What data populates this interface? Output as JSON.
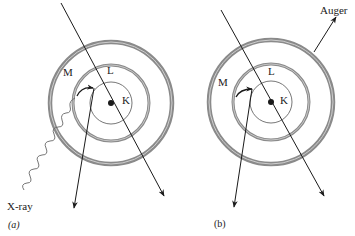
{
  "figure": {
    "panels": [
      {
        "id": "a",
        "caption": "(a)",
        "shells": {
          "M": "M",
          "L": "L",
          "K": "K"
        },
        "radiation_label": "X-ray"
      },
      {
        "id": "b",
        "caption": "(b)",
        "shells": {
          "M": "M",
          "L": "L",
          "K": "K"
        },
        "emission_label": "Auger"
      }
    ],
    "colors": {
      "ring": "#8a8a8a",
      "line": "#1a1a1a",
      "nucleus": "#1a1a1a"
    }
  }
}
